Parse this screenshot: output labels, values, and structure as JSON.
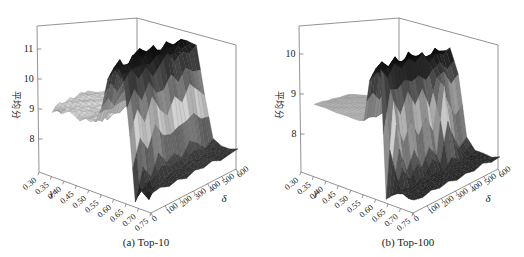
{
  "figure": {
    "background": "#ffffff",
    "frame_color": "#777777",
    "text_color": "#1a1a1a"
  },
  "chart_data": [
    {
      "type": "3d-surface",
      "title": "(a) Top-10",
      "xlabel": "γ",
      "ylabel": "δ",
      "zlabel": "平均分",
      "x_ticks": [
        "0.30",
        "0.35",
        "0.40",
        "0.45",
        "0.50",
        "0.55",
        "0.60",
        "0.65",
        "0.70",
        "0.75"
      ],
      "y_ticks": [
        "0",
        "100",
        "200",
        "300",
        "400",
        "500",
        "600"
      ],
      "z_ticks": [
        "8",
        "9",
        "10",
        "11"
      ],
      "x_range": [
        0.3,
        0.75
      ],
      "y_range": [
        0,
        600
      ],
      "zlim": [
        6.9,
        11.8
      ],
      "colormap": "grayscale: light at mid values, dark at both extremes",
      "x": [
        0.3,
        0.325,
        0.35,
        0.375,
        0.4,
        0.425,
        0.45,
        0.475,
        0.5,
        0.525,
        0.55,
        0.575,
        0.6,
        0.625,
        0.65,
        0.675,
        0.7,
        0.725,
        0.75
      ],
      "y": [
        0,
        60,
        120,
        180,
        240,
        300,
        360,
        420,
        480,
        540,
        600
      ],
      "z": [
        [
          8.75,
          8.9,
          8.98,
          8.85,
          8.92,
          9.0,
          8.88,
          8.95,
          9.02,
          8.9,
          8.96
        ],
        [
          8.9,
          8.72,
          8.95,
          9.05,
          8.88,
          8.85,
          9.0,
          9.08,
          8.93,
          9.0,
          8.9
        ],
        [
          8.85,
          9.0,
          8.78,
          8.92,
          9.05,
          8.95,
          8.88,
          8.96,
          9.05,
          8.94,
          9.0
        ],
        [
          9.0,
          8.88,
          9.04,
          8.9,
          8.97,
          9.06,
          8.93,
          9.0,
          8.9,
          9.05,
          8.95
        ],
        [
          8.92,
          9.05,
          8.88,
          9.0,
          8.86,
          8.95,
          9.05,
          8.9,
          9.0,
          8.95,
          9.02
        ],
        [
          8.8,
          8.93,
          9.0,
          8.85,
          9.02,
          8.92,
          8.98,
          9.04,
          8.9,
          8.98,
          8.93
        ],
        [
          8.95,
          8.85,
          8.68,
          8.95,
          8.9,
          9.0,
          8.9,
          8.95,
          9.03,
          8.92,
          9.0
        ],
        [
          8.9,
          9.0,
          8.95,
          8.72,
          9.0,
          8.94,
          9.02,
          8.88,
          8.96,
          9.04,
          8.9
        ],
        [
          9.05,
          8.9,
          9.1,
          9.0,
          8.92,
          9.05,
          8.95,
          9.1,
          9.0,
          9.08,
          8.98
        ],
        [
          9.5,
          9.72,
          9.4,
          9.65,
          9.8,
          9.55,
          9.7,
          9.45,
          9.6,
          9.75,
          9.5
        ],
        [
          10.4,
          10.7,
          10.3,
          10.6,
          10.9,
          10.5,
          10.75,
          10.45,
          10.65,
          10.8,
          10.5
        ],
        [
          10.7,
          11.0,
          10.6,
          10.95,
          11.15,
          10.7,
          11.05,
          10.8,
          11.1,
          10.9,
          11.0
        ],
        [
          10.9,
          10.6,
          11.1,
          10.8,
          11.05,
          11.2,
          10.85,
          11.0,
          10.7,
          11.1,
          10.95
        ],
        [
          10.5,
          10.8,
          10.4,
          10.7,
          10.3,
          10.6,
          10.9,
          10.5,
          10.75,
          10.6,
          10.8
        ],
        [
          8.9,
          9.6,
          9.1,
          9.8,
          9.3,
          9.0,
          9.5,
          9.2,
          9.7,
          9.4,
          9.1
        ],
        [
          6.98,
          7.9,
          7.5,
          8.1,
          7.7,
          7.85,
          7.6,
          8.0,
          7.8,
          7.5,
          7.7
        ],
        [
          7.4,
          7.0,
          7.55,
          7.38,
          7.5,
          7.45,
          7.6,
          7.4,
          7.55,
          7.45,
          7.5
        ],
        [
          7.5,
          7.42,
          7.5,
          7.38,
          7.52,
          7.4,
          7.48,
          7.55,
          7.42,
          7.5,
          7.45
        ],
        [
          7.45,
          7.5,
          7.4,
          7.48,
          7.38,
          7.5,
          7.44,
          7.52,
          7.4,
          7.46,
          7.5
        ]
      ]
    },
    {
      "type": "3d-surface",
      "title": "(b) Top-100",
      "xlabel": "γ",
      "ylabel": "δ",
      "zlabel": "平均分",
      "x_ticks": [
        "0.30",
        "0.35",
        "0.40",
        "0.45",
        "0.50",
        "0.55",
        "0.60",
        "0.65",
        "0.70",
        "0.75"
      ],
      "y_ticks": [
        "0",
        "100",
        "200",
        "300",
        "400",
        "500",
        "600"
      ],
      "z_ticks": [
        "8",
        "9",
        "10"
      ],
      "x_range": [
        0.3,
        0.75
      ],
      "y_range": [
        0,
        600
      ],
      "zlim": [
        7.05,
        10.7
      ],
      "colormap": "grayscale: light at mid values, dark at both extremes",
      "x": [
        0.3,
        0.325,
        0.35,
        0.375,
        0.4,
        0.425,
        0.45,
        0.475,
        0.5,
        0.525,
        0.55,
        0.575,
        0.6,
        0.625,
        0.65,
        0.675,
        0.7,
        0.725,
        0.75
      ],
      "y": [
        0,
        60,
        120,
        180,
        240,
        300,
        360,
        420,
        480,
        540,
        600
      ],
      "z": [
        [
          8.64,
          8.65,
          8.66,
          8.65,
          8.64,
          8.66,
          8.65,
          8.64,
          8.65,
          8.66,
          8.65
        ],
        [
          8.65,
          8.64,
          8.66,
          8.65,
          8.66,
          8.64,
          8.65,
          8.66,
          8.64,
          8.65,
          8.66
        ],
        [
          8.66,
          8.65,
          8.64,
          8.66,
          8.65,
          8.64,
          8.66,
          8.65,
          8.66,
          8.64,
          8.65
        ],
        [
          8.65,
          8.66,
          8.65,
          8.64,
          8.66,
          8.65,
          8.64,
          8.65,
          8.66,
          8.65,
          8.64
        ],
        [
          8.64,
          8.65,
          8.66,
          8.65,
          8.64,
          8.66,
          8.65,
          8.66,
          8.64,
          8.65,
          8.66
        ],
        [
          8.65,
          8.64,
          8.65,
          8.66,
          8.65,
          8.64,
          8.66,
          8.65,
          8.64,
          8.66,
          8.65
        ],
        [
          8.66,
          8.65,
          8.64,
          8.65,
          8.66,
          8.65,
          8.64,
          8.66,
          8.65,
          8.64,
          8.66
        ],
        [
          8.65,
          8.66,
          8.65,
          8.64,
          8.65,
          8.66,
          8.65,
          8.64,
          8.66,
          8.65,
          8.64
        ],
        [
          8.66,
          8.64,
          8.66,
          8.65,
          8.64,
          8.65,
          8.66,
          8.65,
          8.64,
          8.66,
          8.65
        ],
        [
          8.7,
          8.75,
          8.68,
          8.72,
          8.8,
          8.7,
          8.75,
          8.68,
          8.74,
          8.7,
          8.76
        ],
        [
          9.7,
          9.95,
          9.6,
          9.9,
          10.1,
          9.75,
          10.0,
          9.8,
          10.05,
          9.85,
          9.95
        ],
        [
          9.9,
          10.15,
          10.0,
          10.2,
          9.95,
          10.25,
          10.05,
          10.15,
          9.9,
          10.2,
          10.0
        ],
        [
          10.05,
          9.8,
          10.1,
          9.95,
          10.15,
          10.0,
          10.2,
          9.9,
          10.1,
          10.0,
          10.15
        ],
        [
          7.06,
          9.3,
          8.9,
          9.4,
          9.0,
          9.35,
          8.8,
          9.5,
          9.6,
          9.2,
          9.4
        ],
        [
          7.2,
          8.2,
          7.6,
          8.0,
          7.5,
          7.9,
          7.6,
          9.3,
          8.0,
          7.5,
          7.7
        ],
        [
          7.3,
          7.35,
          7.25,
          7.4,
          7.3,
          7.35,
          7.28,
          7.5,
          7.35,
          7.3,
          7.38
        ],
        [
          7.35,
          7.3,
          7.38,
          7.28,
          7.36,
          7.3,
          7.4,
          7.32,
          7.36,
          7.28,
          7.34
        ],
        [
          7.3,
          7.36,
          7.28,
          7.35,
          7.3,
          7.38,
          7.3,
          7.36,
          7.3,
          7.34,
          7.28
        ],
        [
          7.32,
          7.28,
          7.35,
          7.3,
          7.36,
          7.28,
          7.34,
          7.3,
          7.38,
          7.3,
          7.33
        ]
      ]
    }
  ]
}
